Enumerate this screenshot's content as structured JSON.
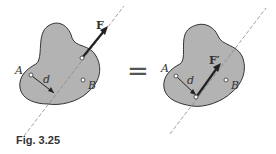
{
  "figure": {
    "caption": "Fig. 3.25",
    "equals_sign": "=",
    "left": {
      "force_label": "F",
      "point_a_label": "A",
      "point_b_label": "B",
      "distance_label": "d"
    },
    "right": {
      "force_label": "F′",
      "point_a_label": "A",
      "point_b_label": "B",
      "distance_label": "d"
    },
    "colors": {
      "body_fill": "#b3b3b3",
      "outline": "#333333",
      "arrow": "#222222",
      "line_of_action": "#888888"
    }
  }
}
